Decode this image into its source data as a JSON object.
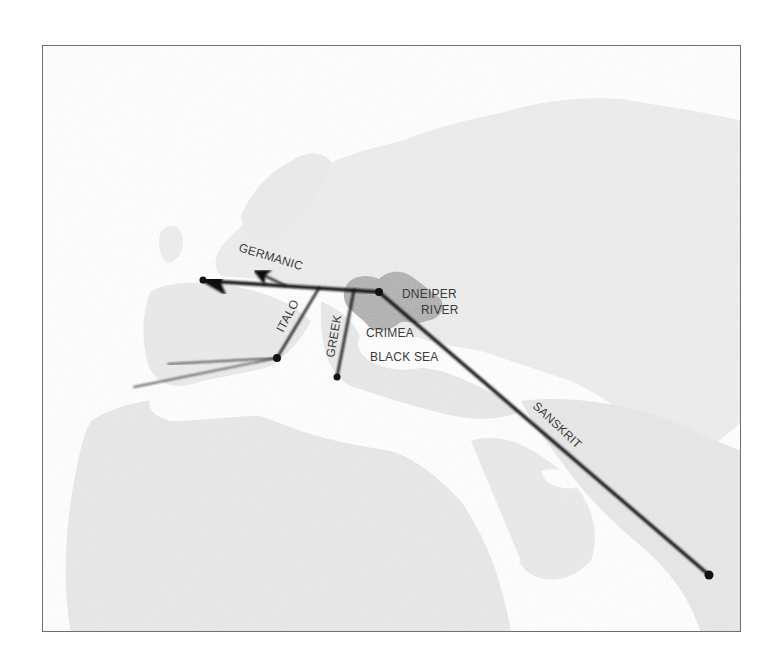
{
  "map": {
    "title": "",
    "colors": {
      "background": "#ffffff",
      "land_light": "#e9e9e9",
      "land_mid": "#dcdcdc",
      "homeland_region": "#a9a9a9",
      "route_line": "#111111",
      "label_text": "#3a3a3a",
      "frame_border": "#6f6f6f"
    },
    "labels": {
      "germanic": "GERMANIC",
      "italo": "ITALO",
      "greek": "GREEK",
      "dneiper": "DNEIPER",
      "river": "RIVER",
      "crimea": "CRIMEA",
      "black_sea": "BLACK SEA",
      "sanskrit": "SANSKRIT"
    },
    "origin": {
      "name": "Dneiper River",
      "x": 378,
      "y": 291
    },
    "routes": [
      {
        "name": "Germanic",
        "from": [
          378,
          291
        ],
        "to": [
          200,
          279
        ],
        "arrow": true
      },
      {
        "name": "Germanic branch",
        "from": [
          285,
          285
        ],
        "to": [
          253,
          270
        ],
        "arrow": true
      },
      {
        "name": "Italo",
        "from": [
          318,
          287
        ],
        "to": [
          276,
          357
        ],
        "arrow": false
      },
      {
        "name": "Italo west branch 1",
        "from": [
          276,
          357
        ],
        "to": [
          167,
          363
        ],
        "arrow": false
      },
      {
        "name": "Italo west branch 2",
        "from": [
          276,
          357
        ],
        "to": [
          133,
          386
        ],
        "arrow": false
      },
      {
        "name": "Greek",
        "from": [
          353,
          289
        ],
        "to": [
          336,
          376
        ],
        "arrow": false
      },
      {
        "name": "Sanskrit",
        "from": [
          378,
          291
        ],
        "to": [
          708,
          574
        ],
        "arrow": false
      }
    ]
  }
}
